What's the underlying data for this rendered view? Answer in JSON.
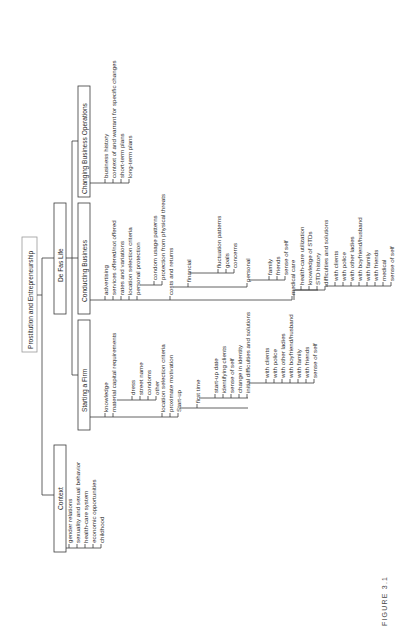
{
  "figure": {
    "caption": "FIGURE 3.1",
    "root": "Prostitution and Entrepreneurship",
    "branches": {
      "context": {
        "label": "Context",
        "items": [
          "gender relations",
          "sexuality and sexual behavior",
          "health-care system",
          "economic opportunities",
          "childhood"
        ]
      },
      "de_fas_life": {
        "label": "De Fas Life",
        "children": {
          "starting_a_firm": {
            "label": "Starting a Firm",
            "items": [
              "knowledge",
              "material capital requirements",
              "location selection criteria",
              "proximate motivation",
              "Start-up"
            ],
            "material_capital": [
              "dress",
              "street name",
              "condoms",
              "other"
            ],
            "start_up": {
              "first_time": "first time",
              "items": [
                "start-up date",
                "identifying clients",
                "sense of self",
                "change in identity",
                "initial difficulties and solutions"
              ],
              "initial_difficulties": [
                "with clients",
                "with police",
                "with other ladies",
                "with boyfriend/husband",
                "with family",
                "with friends",
                "sense of self"
              ]
            }
          },
          "conducting_business": {
            "label": "Conducting Business",
            "items": [
              "advertising",
              "services offered/not offered",
              "rates and variations",
              "location selection criteria",
              "personal protection",
              "costs and returns",
              "medical care"
            ],
            "personal_protection": [
              "condom usage patterns",
              "protection from physical threats"
            ],
            "costs_and_returns": {
              "financial": "financial",
              "financial_items": [
                "fluctuation patterns",
                "goals",
                "concerns"
              ],
              "personal": "personal",
              "personal_items": [
                "family",
                "friends",
                "sense of self"
              ]
            },
            "medical_care": {
              "items": [
                "health-care utilization",
                "knowledge of STDs",
                "STD history",
                "difficulties and solutions"
              ],
              "difficulties": [
                "with clients",
                "with police",
                "with other ladies",
                "with boyfriend/husband",
                "with family",
                "with friends",
                "medical",
                "sense of self"
              ]
            }
          },
          "changing_business_operations": {
            "label": "Changing Business Operations",
            "items": [
              "business history",
              "context of and warrant for specific changes",
              "short-term plans",
              "long-term plans"
            ]
          }
        }
      }
    }
  }
}
